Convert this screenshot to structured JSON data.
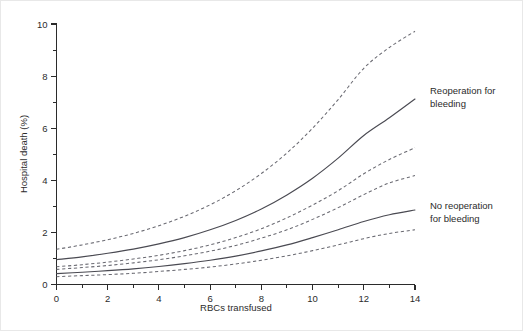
{
  "figure": {
    "background_color": "#ffffff",
    "border_color": "#e8e8e8",
    "curve_color": "#4a4a52",
    "ci_color": "#6a6a72",
    "axis_color": "#2b2b2b"
  },
  "axes": {
    "x_title": "RBCs transfused",
    "y_title": "Hospital death (%)",
    "x_ticks": [
      "0",
      "2",
      "4",
      "6",
      "8",
      "10",
      "12",
      "14"
    ],
    "y_ticks": [
      "0",
      "2",
      "4",
      "6",
      "8",
      "10"
    ]
  },
  "annotations": {
    "upper": {
      "line1": "Reoperation for",
      "line2": "bleeding"
    },
    "lower": {
      "line1": "No reoperation",
      "line2": "for bleeding"
    }
  },
  "chart_data": {
    "type": "line",
    "title": "",
    "xlabel": "RBCs transfused",
    "ylabel": "Hospital death (%)",
    "xlim": [
      0,
      14
    ],
    "ylim": [
      0,
      10
    ],
    "xticks": [
      0,
      2,
      4,
      6,
      8,
      10,
      12,
      14
    ],
    "yticks": [
      0,
      2,
      4,
      6,
      8,
      10
    ],
    "x_minor_tick_step": 1,
    "y_minor_tick_step": 1,
    "grid": false,
    "legend": "annotations at right of curves",
    "x": [
      0,
      1,
      2,
      3,
      4,
      5,
      6,
      7,
      8,
      9,
      10,
      11,
      12,
      13,
      14
    ],
    "series": [
      {
        "name": "Reoperation for bleeding",
        "style": "solid",
        "role": "estimate",
        "values": [
          0.95,
          1.06,
          1.2,
          1.36,
          1.56,
          1.8,
          2.1,
          2.46,
          2.9,
          3.44,
          4.08,
          4.85,
          5.72,
          6.4,
          7.12
        ]
      },
      {
        "name": "Reoperation for bleeding - upper 95% CI",
        "style": "dashed",
        "role": "upper-ci",
        "values": [
          1.35,
          1.52,
          1.72,
          1.96,
          2.26,
          2.62,
          3.06,
          3.6,
          4.26,
          5.05,
          6.0,
          7.1,
          8.3,
          9.1,
          9.72
        ]
      },
      {
        "name": "Reoperation for bleeding - lower 95% CI",
        "style": "dashed",
        "role": "lower-ci",
        "values": [
          0.68,
          0.76,
          0.86,
          0.98,
          1.12,
          1.3,
          1.52,
          1.8,
          2.14,
          2.56,
          3.05,
          3.6,
          4.25,
          4.8,
          5.25
        ]
      },
      {
        "name": "No reoperation for bleeding",
        "style": "solid",
        "role": "estimate",
        "values": [
          0.42,
          0.47,
          0.53,
          0.6,
          0.69,
          0.8,
          0.93,
          1.09,
          1.29,
          1.52,
          1.8,
          2.1,
          2.42,
          2.68,
          2.86
        ]
      },
      {
        "name": "No reoperation for bleeding - upper 95% CI",
        "style": "dashed",
        "role": "upper-ci",
        "values": [
          0.58,
          0.65,
          0.73,
          0.83,
          0.95,
          1.1,
          1.28,
          1.5,
          1.78,
          2.1,
          2.5,
          2.95,
          3.45,
          3.9,
          4.18
        ]
      },
      {
        "name": "No reoperation for bleeding - lower 95% CI",
        "style": "dashed",
        "role": "lower-ci",
        "values": [
          0.3,
          0.34,
          0.38,
          0.43,
          0.5,
          0.58,
          0.67,
          0.79,
          0.93,
          1.1,
          1.3,
          1.52,
          1.76,
          1.96,
          2.1
        ]
      }
    ]
  }
}
